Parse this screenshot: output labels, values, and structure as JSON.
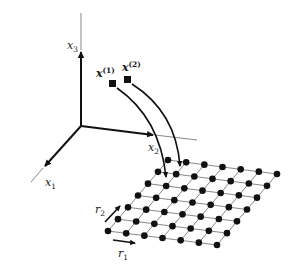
{
  "figure": {
    "type": "diagram",
    "colors": {
      "ink": "#111111",
      "thin_line": "#555555",
      "background": "#ffffff"
    }
  },
  "axes": {
    "x1": {
      "base": "x",
      "sub": "1"
    },
    "x2": {
      "base": "x",
      "sub": "2"
    },
    "x3": {
      "base": "x",
      "sub": "3"
    }
  },
  "points": [
    {
      "base": "x",
      "sup": "(1)"
    },
    {
      "base": "x",
      "sup": "(2)"
    }
  ],
  "lattice": {
    "rows": 7,
    "cols": 7,
    "direction_labels": {
      "r1": {
        "base": "r",
        "sub": "1"
      },
      "r2": {
        "base": "r",
        "sub": "2"
      }
    }
  }
}
